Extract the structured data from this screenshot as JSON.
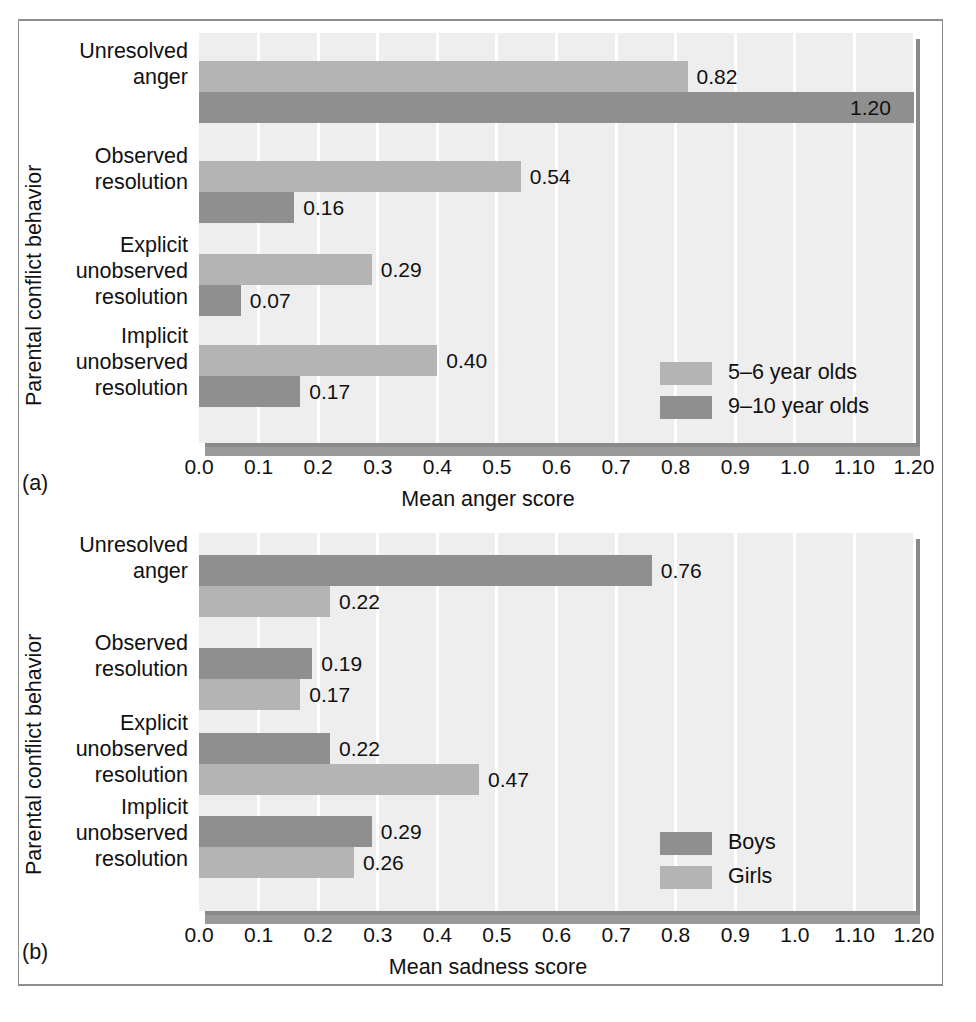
{
  "figure": {
    "panel_a_letter": "(a)",
    "panel_b_letter": "(b)"
  },
  "axis": {
    "y_title": "Parental conflict behavior",
    "ticks": [
      "0.0",
      "0.1",
      "0.2",
      "0.3",
      "0.4",
      "0.5",
      "0.6",
      "0.7",
      "0.8",
      "0.9",
      "1.0",
      "1.10",
      "1.20"
    ],
    "tick_values": [
      0.0,
      0.1,
      0.2,
      0.3,
      0.4,
      0.5,
      0.6,
      0.7,
      0.8,
      0.9,
      1.0,
      1.1,
      1.2
    ],
    "categories": [
      "Unresolved\nanger",
      "Observed\nresolution",
      "Explicit\nunobserved\nresolution",
      "Implicit\nunobserved\nresolution"
    ]
  },
  "colors": {
    "light_gray_bar": "#b4b4b4",
    "dark_gray_bar": "#8f8f8f",
    "plot_background": "#eeeeee",
    "gridline": "#ffffff",
    "shadow": "#8a8a8a",
    "frame": "#8e8e8e"
  },
  "chart_data": [
    {
      "type": "bar",
      "orientation": "horizontal",
      "panel": "(a)",
      "title": "",
      "xlabel": "Mean anger score",
      "ylabel": "Parental conflict behavior",
      "xlim": [
        0.0,
        1.2
      ],
      "grid": true,
      "legend_position": "inside-bottom-right",
      "categories": [
        "Unresolved anger",
        "Observed resolution",
        "Explicit unobserved resolution",
        "Implicit unobserved resolution"
      ],
      "series": [
        {
          "name": "5–6 year olds",
          "color": "#b4b4b4",
          "values": [
            0.82,
            0.54,
            0.29,
            0.4
          ],
          "labels": [
            "0.82",
            "0.54",
            "0.29",
            "0.40"
          ]
        },
        {
          "name": "9–10 year olds",
          "color": "#8f8f8f",
          "values": [
            1.2,
            0.16,
            0.07,
            0.17
          ],
          "labels": [
            "1.20",
            "0.16",
            "0.07",
            "0.17"
          ]
        }
      ]
    },
    {
      "type": "bar",
      "orientation": "horizontal",
      "panel": "(b)",
      "title": "",
      "xlabel": "Mean sadness score",
      "ylabel": "Parental conflict behavior",
      "xlim": [
        0.0,
        1.2
      ],
      "grid": true,
      "legend_position": "inside-bottom-right",
      "categories": [
        "Unresolved anger",
        "Observed resolution",
        "Explicit unobserved resolution",
        "Implicit unobserved resolution"
      ],
      "series": [
        {
          "name": "Boys",
          "color": "#8f8f8f",
          "values": [
            0.76,
            0.19,
            0.22,
            0.29
          ],
          "labels": [
            "0.76",
            "0.19",
            "0.22",
            "0.29"
          ]
        },
        {
          "name": "Girls",
          "color": "#b4b4b4",
          "values": [
            0.22,
            0.17,
            0.47,
            0.26
          ],
          "labels": [
            "0.22",
            "0.17",
            "0.47",
            "0.26"
          ]
        }
      ]
    }
  ]
}
